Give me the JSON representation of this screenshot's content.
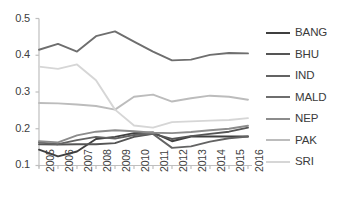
{
  "chart_data": {
    "type": "line",
    "title": "",
    "xlabel": "",
    "ylabel": "",
    "categories": [
      "2005",
      "2006",
      "2007",
      "2008",
      "2009",
      "2010",
      "2011",
      "2012",
      "2013",
      "2014",
      "2015",
      "2016"
    ],
    "x": [
      2005,
      2006,
      2007,
      2008,
      2009,
      2010,
      2011,
      2012,
      2013,
      2014,
      2015,
      2016
    ],
    "ylim": [
      0.1,
      0.5
    ],
    "yticks": [
      "0.5",
      "0.4",
      "0.3",
      "0.2",
      "0.1"
    ],
    "ytick_values": [
      0.5,
      0.4,
      0.3,
      0.2,
      0.1
    ],
    "grid": false,
    "legend_position": "right",
    "series": [
      {
        "name": "BANG",
        "color": "#3f3f3f",
        "values": [
          0.143,
          0.125,
          0.138,
          0.172,
          0.178,
          0.188,
          0.19,
          0.166,
          0.179,
          0.179,
          0.179,
          0.179
        ]
      },
      {
        "name": "BHU",
        "color": "#555555",
        "values": [
          0.158,
          0.157,
          0.158,
          0.158,
          0.161,
          0.178,
          0.186,
          0.172,
          0.18,
          0.186,
          0.192,
          0.203
        ]
      },
      {
        "name": "IND",
        "color": "#636363",
        "values": [
          0.163,
          0.158,
          0.169,
          0.178,
          0.173,
          0.183,
          0.186,
          0.148,
          0.152,
          0.165,
          0.174,
          0.179
        ]
      },
      {
        "name": "MALD",
        "color": "#6e6e6e",
        "values": [
          0.415,
          0.431,
          0.41,
          0.452,
          0.465,
          0.437,
          0.41,
          0.386,
          0.388,
          0.401,
          0.406,
          0.405
        ]
      },
      {
        "name": "NEP",
        "color": "#8c8c8c",
        "values": [
          0.166,
          0.163,
          0.182,
          0.192,
          0.196,
          0.193,
          0.189,
          0.188,
          0.191,
          0.196,
          0.2,
          0.208
        ]
      },
      {
        "name": "PAK",
        "color": "#bcbcbc",
        "values": [
          0.27,
          0.269,
          0.266,
          0.262,
          0.252,
          0.287,
          0.293,
          0.274,
          0.283,
          0.29,
          0.287,
          0.279
        ]
      },
      {
        "name": "SRI",
        "color": "#d6d6d6",
        "values": [
          0.369,
          0.363,
          0.375,
          0.332,
          0.252,
          0.209,
          0.203,
          0.218,
          0.22,
          0.222,
          0.224,
          0.229
        ]
      }
    ]
  },
  "axis": {
    "y_axis_line_color": "#bfbfbf",
    "x_axis_line_color": "#bfbfbf"
  }
}
